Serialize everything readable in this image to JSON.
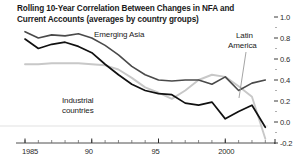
{
  "chart_data": {
    "type": "line",
    "title": "Rolling 10-Year Correlation Between Changes in NFA and Current Accounts (averages by country groups)",
    "title_line1": "Rolling 10-Year Correlation Between Changes in NFA and Current",
    "title_line2": "Accounts (averages by country groups)",
    "xlabel": "",
    "ylabel": "",
    "xlim": [
      1985,
      2003.5
    ],
    "ylim": [
      -0.2,
      1.0
    ],
    "grid": false,
    "legend_position": "inline-annotations",
    "y_ticks": [
      "1.0",
      "0.8",
      "0.6",
      "0.4",
      "0.2",
      "0.0",
      "-0.2"
    ],
    "y_tick_values": [
      1.0,
      0.8,
      0.6,
      0.4,
      0.2,
      0.0,
      -0.2
    ],
    "y_axis_side": "right",
    "x_ticks": [
      "1985",
      "90",
      "95",
      "2000"
    ],
    "x_tick_values": [
      1985,
      1990,
      1995,
      2000
    ],
    "x_minor_tick_interval": 1,
    "x": [
      1985,
      1986,
      1987,
      1988,
      1989,
      1990,
      1991,
      1992,
      1993,
      1994,
      1995,
      1996,
      1997,
      1998,
      1999,
      2000,
      2001,
      2002,
      2003
    ],
    "series": [
      {
        "name": "Emerging Asia",
        "color": "#4a4a4a",
        "width": 1.6,
        "label_x": 94,
        "label_y": 30,
        "values": [
          0.86,
          0.8,
          0.83,
          0.82,
          0.84,
          0.8,
          0.73,
          0.64,
          0.53,
          0.45,
          0.4,
          0.39,
          0.4,
          0.4,
          0.36,
          0.43,
          0.3,
          0.37,
          0.4
        ]
      },
      {
        "name": "Industrial countries",
        "color": "#111111",
        "width": 1.7,
        "label_x": 62,
        "label_y": 96,
        "values": [
          0.79,
          0.7,
          0.74,
          0.76,
          0.72,
          0.66,
          0.55,
          0.45,
          0.36,
          0.3,
          0.27,
          0.26,
          0.18,
          0.16,
          0.19,
          0.03,
          0.1,
          0.16,
          -0.05
        ]
      },
      {
        "name": "Latin America",
        "color": "#c8c8c8",
        "width": 1.9,
        "label_x": 228,
        "label_y": 31,
        "values": [
          0.55,
          0.55,
          0.56,
          0.56,
          0.56,
          0.55,
          0.54,
          0.5,
          0.42,
          0.33,
          0.28,
          0.22,
          0.3,
          0.4,
          0.45,
          0.43,
          0.34,
          0.24,
          -0.16
        ]
      }
    ],
    "annotations": [
      {
        "text": "Emerging Asia",
        "x": 94,
        "y": 30
      },
      {
        "text": "Industrial",
        "x": 62,
        "y": 96
      },
      {
        "text": "countries",
        "x": 62,
        "y": 106
      },
      {
        "text": "Latin",
        "x": 236,
        "y": 31
      },
      {
        "text": "America",
        "x": 228,
        "y": 41
      }
    ],
    "leader_line": {
      "from_x": 246,
      "from_y": 52,
      "to_x": 239,
      "to_y": 98
    }
  }
}
